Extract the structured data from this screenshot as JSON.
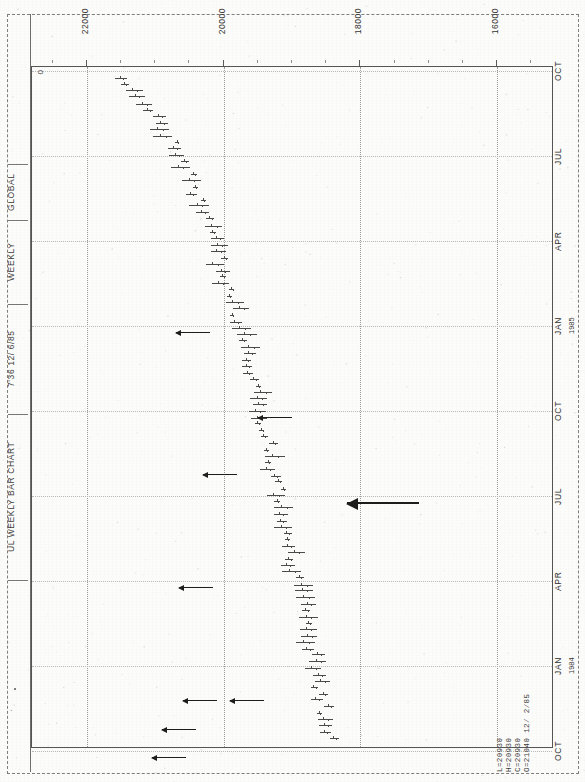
{
  "document": {
    "kind": "fax-scan",
    "title_segments": [
      "UL WEEKLY  BAR CHART",
      "7'36  12/ 6/85",
      "WEEKLY",
      "GLOBAL"
    ],
    "title_full": "UL WEEKLY BAR CHART - 7'36 12/6/85 WEEKLY GLOBAL",
    "zero_marker": "0",
    "corner_mark": "·",
    "stamp_lines": [
      "L=20930",
      "H=20930",
      "C=20930",
      "O=21040  12/ 2/85"
    ]
  },
  "chart_data": {
    "type": "ohlc-bar",
    "subtitle": "WEEKLY GLOBAL",
    "orientation": "rotated-90",
    "xlabel": "",
    "ylabel": "",
    "price_axis": {
      "ticks": [
        22000,
        20000,
        18000,
        16000
      ],
      "tick_labels": [
        "22000",
        "20000",
        "18000",
        "16000"
      ],
      "range": [
        15200,
        22800
      ],
      "minor_interval": 500,
      "grid": true
    },
    "date_axis": {
      "labels": [
        "OCT",
        "JUL",
        "APR",
        "JAN",
        "OCT",
        "JUL",
        "APR",
        "JAN",
        "OCT"
      ],
      "year_marks": [
        {
          "at": "JAN",
          "index": 3,
          "label": "1985"
        },
        {
          "at": "JAN",
          "index": 7,
          "label": "1984"
        }
      ],
      "range": [
        "1983-10",
        "1985-10"
      ],
      "grid": true
    },
    "legend": [],
    "last_quote": {
      "low": 20930,
      "high": 20930,
      "close": 20930,
      "open": 21040,
      "date": "12/ 2/85"
    },
    "annotations": [
      {
        "name": "arrow-1",
        "shape": "arrow-left",
        "size": "small",
        "near_date": "1985-01",
        "near_price": 20700
      },
      {
        "name": "arrow-2",
        "shape": "arrow-left",
        "size": "small",
        "near_date": "1984-08",
        "near_price": 20300
      },
      {
        "name": "arrow-3",
        "shape": "arrow-left",
        "size": "small",
        "near_date": "1984-10",
        "near_price": 19500
      },
      {
        "name": "arrow-4",
        "shape": "arrow-left",
        "size": "small",
        "near_date": "1984-04",
        "near_price": 20650
      },
      {
        "name": "arrow-5",
        "shape": "arrow-left",
        "size": "bold",
        "near_date": "1984-07",
        "near_price": 18200
      },
      {
        "name": "arrow-6",
        "shape": "arrow-left",
        "size": "small",
        "near_date": "1983-11",
        "near_price": 20900
      },
      {
        "name": "arrow-7",
        "shape": "arrow-left",
        "size": "small",
        "near_date": "1983-12",
        "near_price": 20600
      },
      {
        "name": "arrow-8",
        "shape": "arrow-left",
        "size": "small",
        "near_date": "1983-12",
        "near_price": 19900
      },
      {
        "name": "arrow-9",
        "shape": "arrow-left",
        "size": "small",
        "near_date": "1983-10",
        "near_price": 21050
      }
    ],
    "series": [
      {
        "name": "GLOBAL weekly price",
        "unit": "index",
        "note": "Each entry = one week: [price_level, bar_extent]. Price read off the horizontal (rotated) price axis; week index increases downward from OCT 1985 at top to OCT 1983 at bottom.",
        "values": [
          21480,
          21390,
          21310,
          21250,
          21100,
          21050,
          21010,
          20950,
          20890,
          20830,
          20760,
          20700,
          20660,
          20610,
          20570,
          20520,
          20470,
          20430,
          20390,
          20350,
          20300,
          20260,
          20220,
          20200,
          20180,
          20150,
          20120,
          20090,
          20060,
          20030,
          20000,
          19980,
          19950,
          19910,
          19880,
          19850,
          19820,
          19790,
          19760,
          19730,
          19700,
          19680,
          19650,
          19620,
          19600,
          19580,
          19560,
          19540,
          19520,
          19500,
          19480,
          19460,
          19440,
          19420,
          19400,
          19380,
          19360,
          19340,
          19320,
          19300,
          19280,
          19260,
          19240,
          19220,
          19200,
          19180,
          19160,
          19140,
          19120,
          19100,
          19080,
          19060,
          19040,
          19020,
          19000,
          18980,
          18960,
          18940,
          18920,
          18900,
          18880,
          18860,
          18840,
          18820,
          18800,
          18780,
          18760,
          18740,
          18720,
          18700,
          18680,
          18660,
          18640,
          18620,
          18600,
          18580,
          18560,
          18540,
          18520,
          18500,
          18480,
          18460,
          18440,
          18420
        ]
      }
    ]
  },
  "ui": {
    "panel_border_color": "#555555",
    "grid_color": "#9a9a9a",
    "ink_color": "#4a4a4a",
    "annotation_color": "#1d1d1d",
    "paper_color": "#fcfcfa"
  }
}
